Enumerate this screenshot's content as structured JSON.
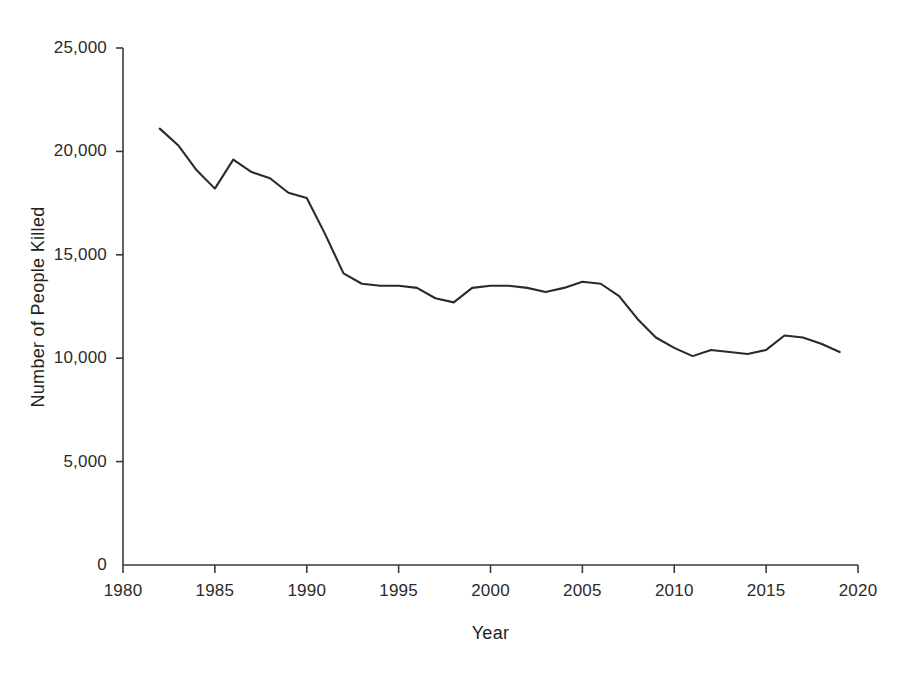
{
  "chart_data": {
    "type": "line",
    "title": "",
    "xlabel": "Year",
    "ylabel": "Number of People Killed",
    "xlim": [
      1980,
      2020
    ],
    "ylim": [
      0,
      25000
    ],
    "grid": false,
    "legend": false,
    "legend_position": "none",
    "line_color": "#2a2a2a",
    "xticks": [
      1980,
      1985,
      1990,
      1995,
      2000,
      2005,
      2010,
      2015,
      2020
    ],
    "xtick_labels": [
      "1980",
      "1985",
      "1990",
      "1995",
      "2000",
      "2005",
      "2010",
      "2015",
      "2020"
    ],
    "yticks": [
      0,
      5000,
      10000,
      15000,
      20000,
      25000
    ],
    "ytick_labels": [
      "0",
      "5,000",
      "10,000",
      "15,000",
      "20,000",
      "25,000"
    ],
    "x": [
      1982,
      1983,
      1984,
      1985,
      1986,
      1987,
      1988,
      1989,
      1990,
      1991,
      1992,
      1993,
      1994,
      1995,
      1996,
      1997,
      1998,
      1999,
      2000,
      2001,
      2002,
      2003,
      2004,
      2005,
      2006,
      2007,
      2008,
      2009,
      2010,
      2011,
      2012,
      2013,
      2014,
      2015,
      2016,
      2017,
      2018,
      2019
    ],
    "values": [
      21100,
      20300,
      19100,
      18200,
      19600,
      19000,
      18700,
      18000,
      17750,
      16000,
      14100,
      13600,
      13500,
      13500,
      13400,
      12900,
      12700,
      13400,
      13500,
      13500,
      13400,
      13200,
      13400,
      13700,
      13600,
      13000,
      11900,
      11000,
      10500,
      10100,
      10400,
      10300,
      10200,
      10400,
      11100,
      11000,
      10700,
      10300
    ]
  }
}
